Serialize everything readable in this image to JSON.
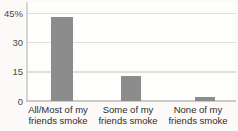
{
  "chart_data": {
    "type": "bar",
    "categories": [
      "All/Most of my\nfriends smoke",
      "Some of my\nfriends smoke",
      "None of my\nfriends smoke"
    ],
    "values": [
      43,
      13,
      2
    ],
    "title": "",
    "xlabel": "",
    "ylabel": "",
    "ylim": [
      0,
      50
    ],
    "yticks": [
      {
        "value": 0,
        "label": "0"
      },
      {
        "value": 15,
        "label": "15"
      },
      {
        "value": 30,
        "label": "30"
      },
      {
        "value": 45,
        "label": "45%"
      }
    ],
    "grid": true,
    "legend": false
  },
  "colors": {
    "bar": "#8c8c8c",
    "gridline": "#e0dfdc",
    "axis_line": "#d6d5d2",
    "baseline": "#cbcac6",
    "tick_text": "#4a4a48",
    "label_text": "#2e2d2b",
    "background": "#fbfaf8"
  }
}
